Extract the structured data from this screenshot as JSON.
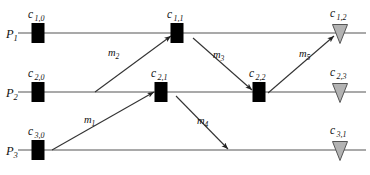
{
  "figure": {
    "kind": "space-time-diagram",
    "width": 370,
    "height": 175,
    "background_color": "#ffffff",
    "line_color": "#8c8c8c",
    "send_event_color": "#000000",
    "receive_event_color": "#b3b3b3",
    "receive_event_stroke": "#555555",
    "arrow_color": "#333333",
    "text_color": "#111111"
  },
  "processes": [
    {
      "id": "P1",
      "label_main": "P",
      "label_sub": "1",
      "name": "process-p1",
      "axis_y": 33,
      "axis_x_start": 18,
      "axis_x_end": 366
    },
    {
      "id": "P2",
      "label_main": "P",
      "label_sub": "2",
      "name": "process-p2",
      "axis_y": 92,
      "axis_x_start": 18,
      "axis_x_end": 366
    },
    {
      "id": "P3",
      "label_main": "P",
      "label_sub": "3",
      "name": "process-p3",
      "axis_y": 150,
      "axis_x_start": 18,
      "axis_x_end": 366
    }
  ],
  "process_label_positions": [
    {
      "x": 6,
      "y": 38
    },
    {
      "x": 6,
      "y": 97
    },
    {
      "x": 6,
      "y": 155
    }
  ],
  "events": [
    {
      "id": "c_1_0",
      "name": "event-c-1-0",
      "label_main": "c",
      "label_sub": "1,0",
      "shape": "square",
      "process": "P1",
      "x": 38,
      "y": 33,
      "label_x": 28,
      "label_y": 18
    },
    {
      "id": "c_1_1",
      "name": "event-c-1-1",
      "label_main": "c",
      "label_sub": "1,1",
      "shape": "square",
      "process": "P1",
      "x": 177,
      "y": 33,
      "label_x": 167,
      "label_y": 18
    },
    {
      "id": "c_1_2",
      "name": "event-c-1-2",
      "label_main": "c",
      "label_sub": "1,2",
      "shape": "triangle",
      "process": "P1",
      "x": 340,
      "y": 33,
      "label_x": 330,
      "label_y": 17
    },
    {
      "id": "c_2_0",
      "name": "event-c-2-0",
      "label_main": "c",
      "label_sub": "2,0",
      "shape": "square",
      "process": "P2",
      "x": 38,
      "y": 92,
      "label_x": 28,
      "label_y": 77
    },
    {
      "id": "c_2_1",
      "name": "event-c-2-1",
      "label_main": "c",
      "label_sub": "2,1",
      "shape": "square",
      "process": "P2",
      "x": 161,
      "y": 92,
      "label_x": 151,
      "label_y": 77
    },
    {
      "id": "c_2_2",
      "name": "event-c-2-2",
      "label_main": "c",
      "label_sub": "2,2",
      "shape": "square",
      "process": "P2",
      "x": 259,
      "y": 92,
      "label_x": 249,
      "label_y": 77
    },
    {
      "id": "c_2_3",
      "name": "event-c-2-3",
      "label_main": "c",
      "label_sub": "2,3",
      "shape": "triangle",
      "process": "P2",
      "x": 340,
      "y": 92,
      "label_x": 330,
      "label_y": 76
    },
    {
      "id": "c_3_0",
      "name": "event-c-3-0",
      "label_main": "c",
      "label_sub": "3,0",
      "shape": "square",
      "process": "P3",
      "x": 38,
      "y": 150,
      "label_x": 28,
      "label_y": 135
    },
    {
      "id": "c_3_1",
      "name": "event-c-3-1",
      "label_main": "c",
      "label_sub": "3,1",
      "shape": "triangle",
      "process": "P3",
      "x": 340,
      "y": 150,
      "label_x": 330,
      "label_y": 134
    }
  ],
  "messages": [
    {
      "id": "m1",
      "name": "message-m1",
      "label_main": "m",
      "label_sub": "1",
      "from_event": "c_3_0",
      "to_event": "c_2_1",
      "x1": 52,
      "y1": 150,
      "x2": 154,
      "y2": 92,
      "label_x": 84,
      "label_y": 123
    },
    {
      "id": "m2",
      "name": "message-m2",
      "label_main": "m",
      "label_sub": "2",
      "from_event": "c_2_1",
      "to_event": "c_1_1",
      "x1": 95,
      "y1": 92,
      "x2": 171,
      "y2": 36,
      "label_x": 108,
      "label_y": 56
    },
    {
      "id": "m3",
      "name": "message-m3",
      "label_main": "m",
      "label_sub": "3",
      "from_event": "c_1_1",
      "to_event": "c_2_2",
      "x1": 193,
      "y1": 38,
      "x2": 252,
      "y2": 90,
      "label_x": 213,
      "label_y": 58
    },
    {
      "id": "m4",
      "name": "message-m4",
      "label_main": "m",
      "label_sub": "4",
      "from_event": "c_2_1",
      "to_event": "c_3_1",
      "x1": 176,
      "y1": 96,
      "x2": 228,
      "y2": 149,
      "label_x": 197,
      "label_y": 124
    },
    {
      "id": "m5",
      "name": "message-m5",
      "label_main": "m",
      "label_sub": "5",
      "from_event": "c_2_2",
      "to_event": "c_1_2",
      "x1": 268,
      "y1": 93,
      "x2": 334,
      "y2": 36,
      "label_x": 299,
      "label_y": 57
    }
  ]
}
